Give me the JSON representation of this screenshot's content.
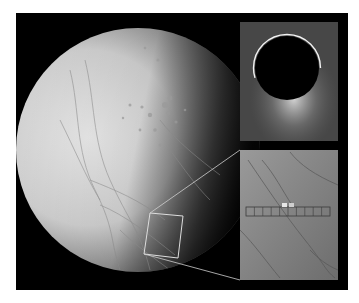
{
  "figure": {
    "background": "#000000",
    "frame": {
      "x": 16,
      "y": 13,
      "width": 332,
      "height": 277
    },
    "moon": {
      "center": [
        138,
        150
      ],
      "radius": 122,
      "lit_color": "#e6e6e6",
      "shadow_color": "#111111"
    },
    "inset_top": {
      "label": "eclipse-plume-inset",
      "x": 240,
      "y": 22,
      "width": 98,
      "height": 119,
      "background": "#4a4a4a",
      "disk_center": [
        287,
        68
      ],
      "disk_radius": 32
    },
    "inset_bottom": {
      "label": "surface-closeup-inset",
      "x": 240,
      "y": 150,
      "width": 98,
      "height": 130,
      "background": "#8e8e8e",
      "scan_strip": {
        "y": 207,
        "height": 9,
        "x_start": 246,
        "x_end": 330,
        "segments": 10
      }
    },
    "selection_box": {
      "points": [
        [
          150,
          213
        ],
        [
          183,
          216
        ],
        [
          178,
          258
        ],
        [
          144,
          254
        ]
      ],
      "stroke": "#dddddd"
    },
    "connectors": [
      {
        "from": [
          150,
          213
        ],
        "to": [
          240,
          150
        ]
      },
      {
        "from": [
          144,
          254
        ],
        "to": [
          240,
          280
        ]
      }
    ]
  }
}
